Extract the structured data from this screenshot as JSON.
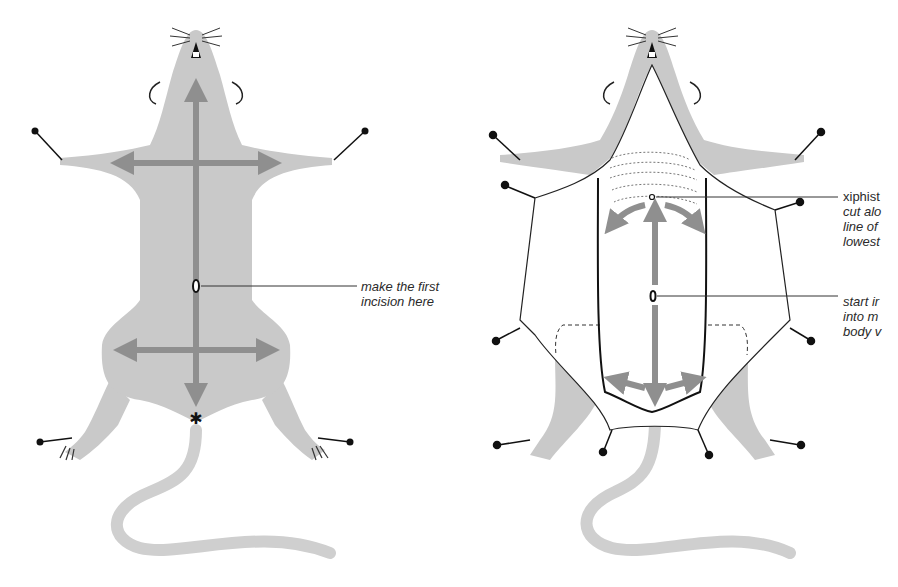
{
  "figure": {
    "colors": {
      "body": "#c9c9c9",
      "arrow": "#8f8f8f",
      "outline": "#1a1a1a",
      "background": "#ffffff",
      "text": "#2a2a2a"
    },
    "left_panel": {
      "name": "rat-ventral-view-before-incision",
      "annotations": [
        {
          "id": "first-incision",
          "lines": [
            "make the first",
            "incision here"
          ]
        }
      ]
    },
    "right_panel": {
      "name": "rat-skin-reflected-pinned",
      "annotations": [
        {
          "id": "xiphisternum",
          "lines": [
            "xiphist",
            "cut alo",
            "line of",
            "lowest"
          ]
        },
        {
          "id": "start-incision",
          "lines": [
            "start ir",
            "into m",
            "body v"
          ]
        }
      ]
    }
  }
}
